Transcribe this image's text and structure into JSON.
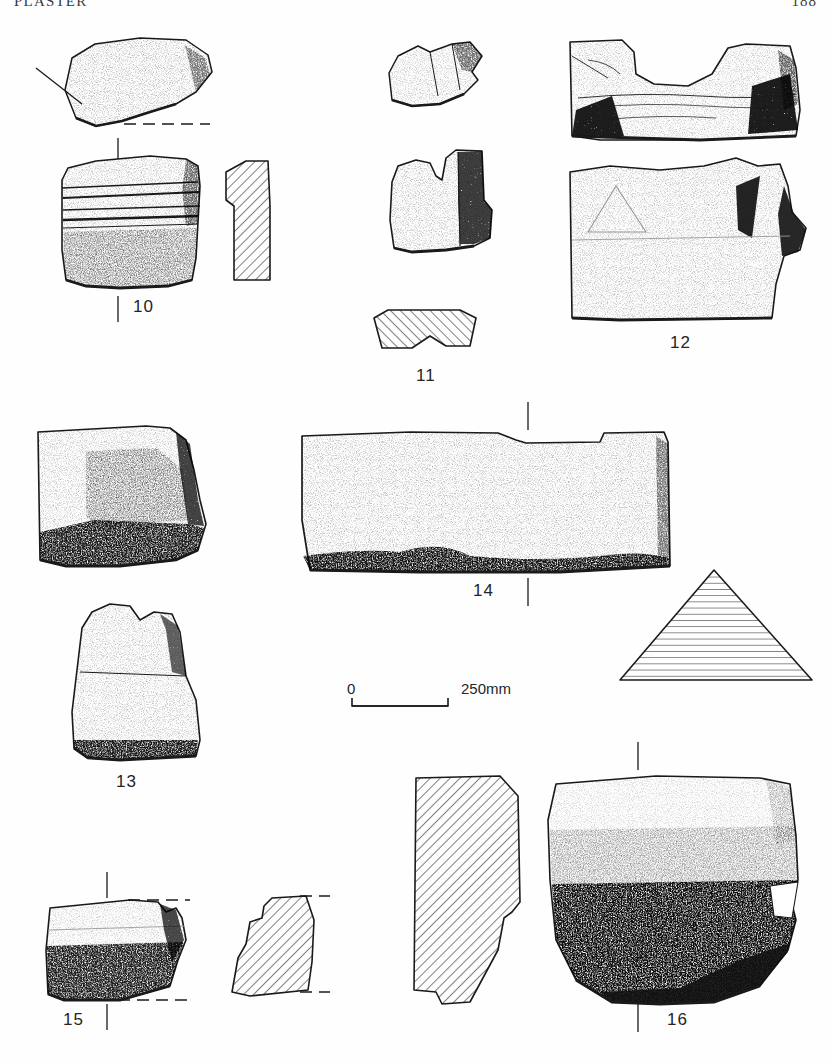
{
  "header": {
    "running_head": "PLASTER",
    "folio": "188"
  },
  "plate": {
    "scale_bar": {
      "start_label": "0",
      "end_label": "250mm"
    },
    "figures": [
      {
        "id": "10",
        "caption": "10",
        "views": [
          "top-plan",
          "front-elevation",
          "hatched-section"
        ],
        "caption_x": 133,
        "caption_y": 297
      },
      {
        "id": "11",
        "caption": "11",
        "views": [
          "top-plan",
          "front-elevation",
          "hatched-section"
        ],
        "caption_x": 418,
        "caption_y": 366
      },
      {
        "id": "12",
        "caption": "12",
        "views": [
          "top-plan",
          "front-elevation"
        ],
        "caption_x": 672,
        "caption_y": 333
      },
      {
        "id": "13",
        "caption": "13",
        "views": [
          "front-elevation",
          "side-elevation"
        ],
        "caption_x": 117,
        "caption_y": 772
      },
      {
        "id": "14",
        "caption": "14",
        "views": [
          "front-elevation",
          "triangular-hatched-section"
        ],
        "caption_x": 474,
        "caption_y": 581
      },
      {
        "id": "15",
        "caption": "15",
        "views": [
          "front-elevation",
          "hatched-section"
        ],
        "caption_x": 64,
        "caption_y": 1010
      },
      {
        "id": "16",
        "caption": "16",
        "views": [
          "hatched-section",
          "front-elevation"
        ],
        "caption_x": 668,
        "caption_y": 1010
      }
    ]
  },
  "style": {
    "ink": "#1a1a1a",
    "stipple": "#2a2a2a",
    "paper": "#fefefe",
    "hatch": "#222222"
  }
}
